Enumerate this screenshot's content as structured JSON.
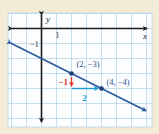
{
  "figure": {
    "background_color": "#f2ecd7",
    "plot_background": "#fcfdfe",
    "grid_color": "#b7d5e8",
    "axis_color": "#1c1c1c",
    "tick_text_color": "#333333"
  },
  "chart_data": {
    "type": "line",
    "title": "",
    "grid": true,
    "xlim": [
      -2.2,
      7.0
    ],
    "ylim": [
      -6.6,
      1.05
    ],
    "axis_labels": {
      "x": "x",
      "y": "y"
    },
    "tick_labels": {
      "x": [
        {
          "value": 1,
          "label": "1"
        }
      ],
      "y": [
        {
          "value": -1,
          "label": "−1"
        }
      ]
    },
    "line": {
      "slope": -0.5,
      "intercept": -2,
      "color": "#2b5b9c"
    },
    "point_color": "#1e3f78",
    "point_label_color": "#28548e",
    "points": [
      {
        "x": 2,
        "y": -3,
        "label": "(2, −3)"
      },
      {
        "x": 4,
        "y": -4,
        "label": "(4, −4)"
      }
    ],
    "slope_triangle": {
      "rise": {
        "value": -1,
        "label": "−1",
        "color": "#d8392b",
        "from": [
          2,
          -3
        ],
        "to": [
          2,
          -4
        ]
      },
      "run": {
        "value": 2,
        "label": "2",
        "color": "#1f9dd9",
        "from": [
          2,
          -4
        ],
        "to": [
          4,
          -4
        ]
      }
    }
  }
}
